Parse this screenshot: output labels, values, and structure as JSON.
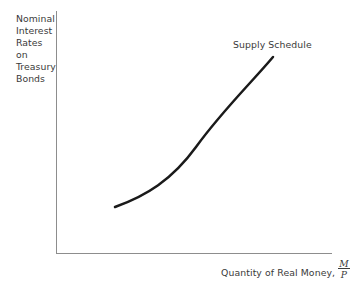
{
  "figure": {
    "background_color": "#ffffff",
    "axis_color": "#8d8d8d",
    "curve_color": "#1a1a1a",
    "text_color": "#3a3a3a"
  },
  "y_axis_label": {
    "lines": [
      "Nominal",
      "Interest",
      "Rates",
      "on",
      "Treasury",
      "Bonds"
    ]
  },
  "x_axis_label": {
    "text": "Quantity of Real Money,",
    "fraction_numerator": "M",
    "fraction_denominator": "P"
  },
  "curve_label": {
    "text": "Supply Schedule"
  },
  "chart_data": {
    "type": "line",
    "title": "",
    "xlabel": "Quantity of Real Money, M/P",
    "ylabel": "Nominal Interest Rates on Treasury Bonds",
    "grid": false,
    "legend_position": "inline-above-curve-right",
    "axis_ticks": {
      "x": [],
      "y": []
    },
    "xlim": [
      0,
      1
    ],
    "ylim": [
      0,
      1
    ],
    "series": [
      {
        "name": "Supply Schedule",
        "shape": "convex-increasing",
        "x": [
          0.21,
          0.32,
          0.43,
          0.54,
          0.65,
          0.76,
          0.87,
          0.94
        ],
        "y": [
          0.19,
          0.24,
          0.31,
          0.4,
          0.52,
          0.65,
          0.78,
          0.85
        ],
        "points_px": [
          [
            115,
            207
          ],
          [
            134,
            198
          ],
          [
            153,
            186
          ],
          [
            173,
            170
          ],
          [
            194,
            148
          ],
          [
            216,
            123
          ],
          [
            245,
            92
          ],
          [
            273,
            57
          ]
        ],
        "path_d": "M 115 207 C 146 196 172 180 196 147 C 222 111 252 82 273 57"
      }
    ]
  },
  "axes_geometry": {
    "y_axis": {
      "x": 56,
      "y_top": 11,
      "y_bottom": 253
    },
    "x_axis": {
      "y": 253,
      "x_left": 56,
      "x_right": 332
    }
  }
}
